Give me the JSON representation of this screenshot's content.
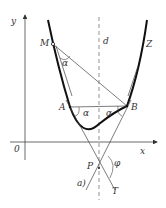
{
  "diagram": {
    "caption": "a)",
    "labels": {
      "y_axis": "y",
      "x_axis": "x",
      "origin": "0",
      "axis_line": "d",
      "curve": "Z",
      "point_M": "M",
      "point_A": "A",
      "point_B": "B",
      "point_P": "P",
      "point_T": "T",
      "angle_alpha_M": "α",
      "angle_alpha_A": "α",
      "angle_alpha_B": "α",
      "angle_phi": "φ"
    },
    "colors": {
      "line": "#333333",
      "curve": "#111111",
      "background": "#ffffff"
    }
  }
}
